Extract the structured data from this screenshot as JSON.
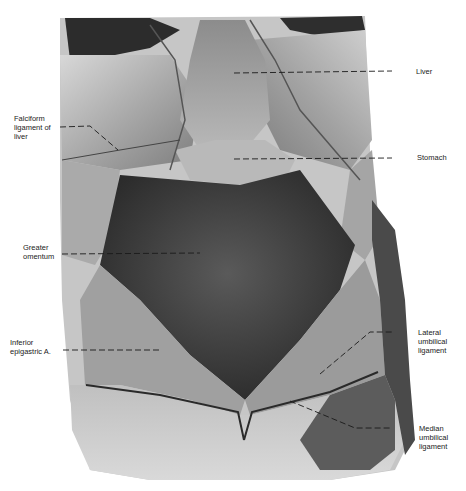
{
  "figure": {
    "colors": {
      "background": "#ffffff",
      "tissue_light": "#cfcfcf",
      "tissue_mid": "#8a8a8a",
      "tissue_dark": "#3a3a3a",
      "leader_line": "#1a1a1a",
      "label_text": "#222222"
    }
  },
  "labels": {
    "left": [
      {
        "id": "falciform",
        "text": "Falciform\nligament of\nliver"
      },
      {
        "id": "greater_omentum",
        "text": "Greater\nomentum"
      },
      {
        "id": "inferior_epigastric",
        "text": "Inferior\nepigastric A."
      }
    ],
    "right": [
      {
        "id": "liver",
        "text": "Liver"
      },
      {
        "id": "stomach",
        "text": "Stomach"
      },
      {
        "id": "lateral_umbilical",
        "text": "Lateral\numbilical\nligament"
      },
      {
        "id": "median_umbilical",
        "text": "Median\numbilical\nligament"
      }
    ]
  }
}
